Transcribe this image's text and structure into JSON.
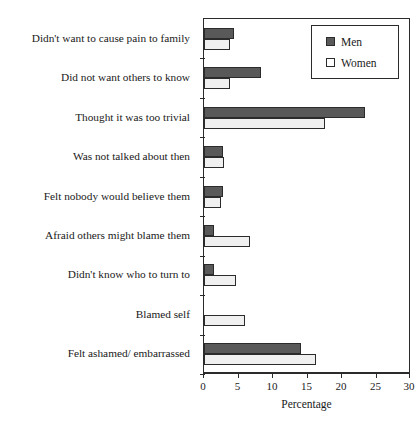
{
  "chart_data": {
    "type": "bar",
    "orientation": "horizontal",
    "title": "",
    "xlabel": "Percentage",
    "ylabel": "",
    "xlim": [
      0,
      30
    ],
    "xticks": [
      0,
      5,
      10,
      15,
      20,
      25,
      30
    ],
    "grid": false,
    "legend_position": "top-right",
    "categories": [
      "Didn't want to cause pain to family",
      "Did not want others to know",
      "Thought it was too trivial",
      "Was not talked about then",
      "Felt nobody would believe them",
      "Afraid others might blame them",
      "Didn't know who to turn to",
      "Blamed self",
      "Felt ashamed/ embarrassed"
    ],
    "series": [
      {
        "name": "Men",
        "color": "#595959",
        "values": [
          4.3,
          8.2,
          23.4,
          2.8,
          2.8,
          1.4,
          1.4,
          0,
          14.0
        ]
      },
      {
        "name": "Women",
        "color": "#f0f0f0",
        "values": [
          3.8,
          3.8,
          17.6,
          2.9,
          2.4,
          6.7,
          4.6,
          5.9,
          16.3
        ]
      }
    ]
  },
  "legend": {
    "entries": [
      {
        "label": "Men",
        "swatch": "men"
      },
      {
        "label": "Women",
        "swatch": "women"
      }
    ]
  }
}
